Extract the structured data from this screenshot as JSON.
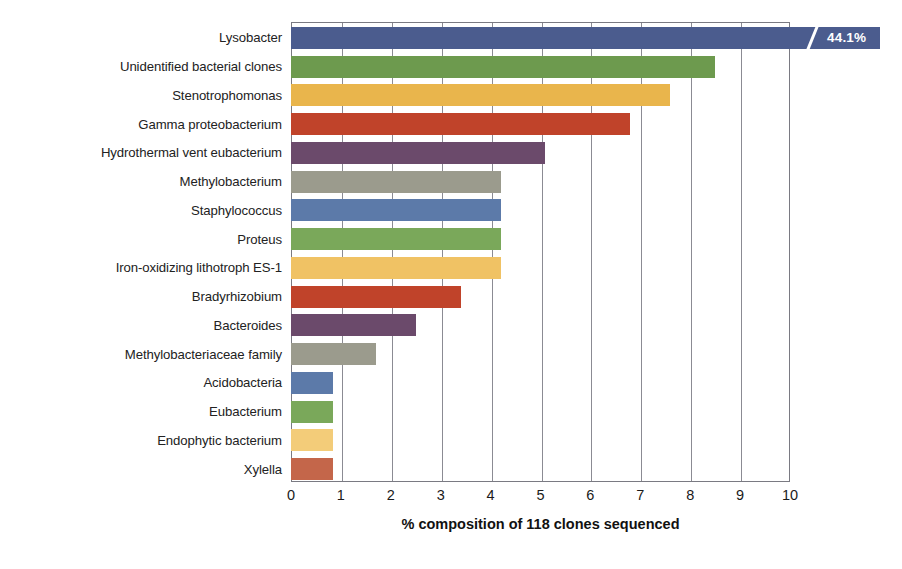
{
  "chart_data": {
    "type": "bar",
    "orientation": "horizontal",
    "title": "",
    "xlabel": "% composition of 118 clones sequenced",
    "ylabel": "",
    "xlim": [
      0,
      10
    ],
    "xticks": [
      0,
      1,
      2,
      3,
      4,
      5,
      6,
      7,
      8,
      9,
      10
    ],
    "grid": true,
    "grid_axis": "x",
    "legend": "none",
    "axis_break_note": "Top bar is truncated with a break mark; its true value 44.1% is printed inside the bar",
    "categories": [
      "Lysobacter",
      "Unidentified bacterial clones",
      "Stenotrophomonas",
      "Gamma proteobacterium",
      "Hydrothermal vent eubacterium",
      "Methylobacterium",
      "Staphylococcus",
      "Proteus",
      "Iron-oxidizing lithotroph ES-1",
      "Bradyrhizobium",
      "Bacteroides",
      "Methylobacteriaceae family",
      "Acidobacteria",
      "Eubacterium",
      "Endophytic bacterium",
      "Xylella"
    ],
    "values": [
      44.1,
      8.5,
      7.6,
      6.8,
      5.1,
      4.2,
      4.2,
      4.2,
      4.2,
      3.4,
      2.5,
      1.7,
      0.85,
      0.85,
      0.85,
      0.85
    ],
    "data_labels": [
      "44.1%",
      "",
      "",
      "",
      "",
      "",
      "",
      "",
      "",
      "",
      "",
      "",
      "",
      "",
      "",
      ""
    ],
    "bar_colors": [
      "#4b5c8e",
      "#6d9a4e",
      "#e9b54c",
      "#c0432a",
      "#6b4a6b",
      "#9b9b8d",
      "#5c7aa9",
      "#7aa85a",
      "#f0c264",
      "#c0432a",
      "#6b4a6b",
      "#9b9b8d",
      "#5c7aa9",
      "#7aa85a",
      "#f3cc79",
      "#c4664a"
    ]
  },
  "axis": {
    "tick_color": "#8b8b93",
    "frame_color": "#7a7a82",
    "text_color": "#1a1a1a"
  }
}
